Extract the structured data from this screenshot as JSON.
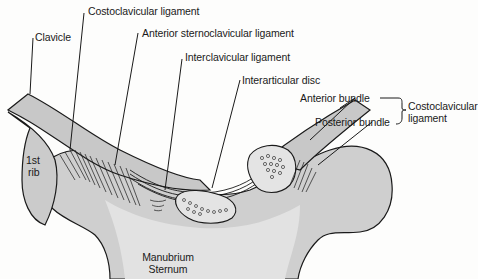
{
  "diagram": {
    "colors": {
      "bone_fill": "#c9c9c9",
      "bone_light": "#dedede",
      "outline": "#1a1a1a",
      "background": "#fdfdfc"
    },
    "labels": {
      "clavicle": "Clavicle",
      "costoclavicular_ligament": "Costoclavicular ligament",
      "anterior_sternoclavicular_ligament": "Anterior sternoclavicular ligament",
      "interclavicular_ligament": "Interclavicular ligament",
      "interarticular_disc": "Interarticular disc",
      "anterior_bundle": "Anterior bundle",
      "posterior_bundle": "Posterior bundle",
      "bracket_group_line1": "Costoclavicular",
      "bracket_group_line2": "ligament",
      "first_rib_line1": "1st",
      "first_rib_line2": "rib",
      "manubrium_line1": "Manubrium",
      "manubrium_line2": "Sternum"
    }
  }
}
